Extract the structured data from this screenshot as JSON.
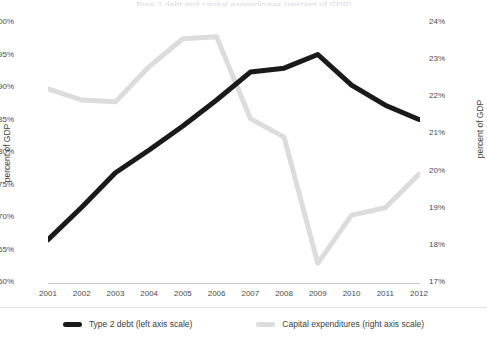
{
  "title": {
    "text": "Type 2 debt and capital expenditures (percent of GDP)"
  },
  "axes": {
    "left": {
      "label": "percent of GDP",
      "ticks": [
        "100%",
        "95%",
        "90%",
        "85%",
        "80%",
        "75%",
        "70%",
        "65%",
        "60%"
      ],
      "min": 60,
      "max": 100,
      "step": 5
    },
    "right": {
      "label": "percent of GDP",
      "ticks": [
        "24%",
        "23%",
        "22%",
        "21%",
        "20%",
        "19%",
        "18%",
        "17%"
      ],
      "min": 17,
      "max": 24,
      "step": 1
    },
    "x": {
      "label": "",
      "ticks": [
        "2001",
        "2002",
        "2003",
        "2004",
        "2005",
        "2006",
        "2007",
        "2008",
        "2009",
        "2010",
        "2011",
        "2012"
      ]
    }
  },
  "legend": {
    "position": "bottom",
    "entries": [
      {
        "label": "Type 2 debt (left axis scale)",
        "color": "#1a1a1a"
      },
      {
        "label": "Capital expenditures (right axis scale)",
        "color": "#dcdcdc"
      }
    ]
  },
  "colors": {
    "debt_line": "#1a1a1a",
    "capex_line": "#dcdcdc",
    "axis": "#c9c9c9",
    "text": "#3d3d3d",
    "background": "#ffffff"
  },
  "chart_data": {
    "type": "line",
    "title": "Type 2 debt and capital expenditures (percent of GDP)",
    "xlabel": "",
    "ylabel": "percent of GDP",
    "y2label": "percent of GDP",
    "grid": false,
    "legend_position": "bottom",
    "x": [
      2001,
      2002,
      2003,
      2004,
      2005,
      2006,
      2007,
      2008,
      2009,
      2010,
      2011,
      2012
    ],
    "categories": [
      "2001",
      "2002",
      "2003",
      "2004",
      "2005",
      "2006",
      "2007",
      "2008",
      "2009",
      "2010",
      "2011",
      "2012"
    ],
    "ylim": [
      60,
      100
    ],
    "y2lim": [
      17,
      24
    ],
    "series": [
      {
        "name": "Type 2 debt (left axis scale)",
        "axis": "left",
        "color": "#1a1a1a",
        "values": [
          66.5,
          71.5,
          76.8,
          80.3,
          84.0,
          88.0,
          92.3,
          92.9,
          95.0,
          90.3,
          87.2,
          85.0
        ]
      },
      {
        "name": "Capital expenditures (right axis scale)",
        "axis": "right",
        "color": "#dcdcdc",
        "values": [
          22.2,
          21.9,
          21.85,
          22.8,
          23.55,
          23.6,
          21.4,
          20.9,
          17.5,
          18.8,
          19.0,
          19.9
        ]
      }
    ]
  }
}
